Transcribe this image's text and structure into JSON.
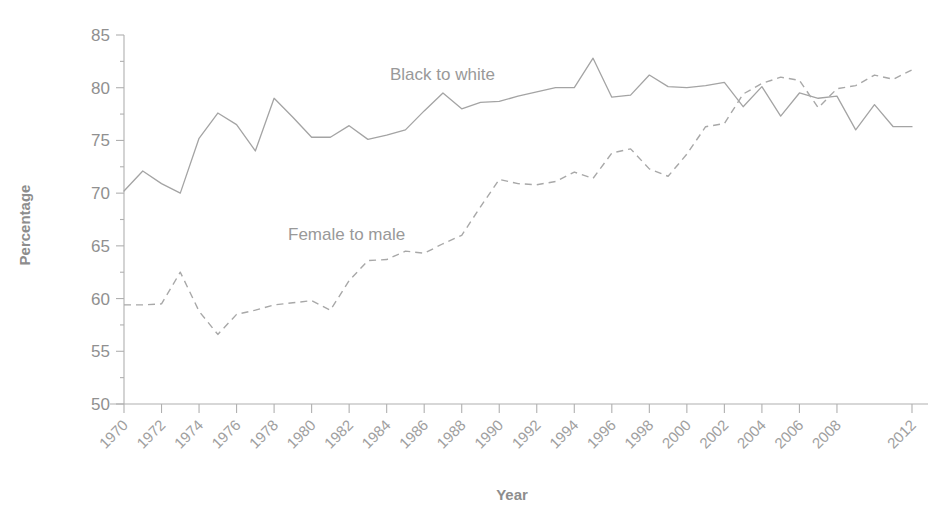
{
  "chart_data": {
    "type": "line",
    "title": "",
    "xlabel": "Year",
    "ylabel": "Percentage",
    "xlim": [
      1970,
      2012
    ],
    "ylim": [
      50,
      85
    ],
    "ytick_labels": [
      "85",
      "80",
      "75",
      "70",
      "65",
      "60",
      "55",
      "50"
    ],
    "yticks": [
      85,
      80,
      75,
      70,
      65,
      60,
      55,
      50
    ],
    "xtick_labels": [
      "1970",
      "1972",
      "1974",
      "1976",
      "1978",
      "1980",
      "1982",
      "1984",
      "1986",
      "1988",
      "1990",
      "1992",
      "1994",
      "1996",
      "1998",
      "2000",
      "2002",
      "2004",
      "2006",
      "2008",
      "2012"
    ],
    "xticks": [
      1970,
      1972,
      1974,
      1976,
      1978,
      1980,
      1982,
      1984,
      1986,
      1988,
      1990,
      1992,
      1994,
      1996,
      1998,
      2000,
      2002,
      2004,
      2006,
      2008,
      2012
    ],
    "grid": false,
    "legend_position": "inline-annotation",
    "x": [
      1970,
      1971,
      1972,
      1973,
      1974,
      1975,
      1976,
      1977,
      1978,
      1979,
      1980,
      1981,
      1982,
      1983,
      1984,
      1985,
      1986,
      1987,
      1988,
      1989,
      1990,
      1991,
      1992,
      1993,
      1994,
      1995,
      1996,
      1997,
      1998,
      1999,
      2000,
      2001,
      2002,
      2003,
      2004,
      2005,
      2006,
      2007,
      2008,
      2009,
      2010,
      2011,
      2012
    ],
    "series": [
      {
        "name": "Black to white",
        "style": "solid",
        "color": "#a4a4a4",
        "annotation": "Black to white",
        "values": [
          70.2,
          72.1,
          70.9,
          70.0,
          75.2,
          77.6,
          76.5,
          74.0,
          79.0,
          77.2,
          75.3,
          75.3,
          76.4,
          75.1,
          75.5,
          76.0,
          77.8,
          79.5,
          78.0,
          78.6,
          78.7,
          79.2,
          79.6,
          80.0,
          80.0,
          82.8,
          79.1,
          79.3,
          81.2,
          80.1,
          80.0,
          80.2,
          80.5,
          78.2,
          80.1,
          77.3,
          79.5,
          79.0,
          79.2,
          76.0,
          78.4,
          76.3,
          76.3
        ]
      },
      {
        "name": "Female to male",
        "style": "dashed",
        "color": "#a8a8a8",
        "annotation": "Female to male",
        "values": [
          59.4,
          59.4,
          59.5,
          62.5,
          58.8,
          56.6,
          58.5,
          58.9,
          59.4,
          59.6,
          59.8,
          58.9,
          61.7,
          63.6,
          63.7,
          64.5,
          64.3,
          65.2,
          66.0,
          68.7,
          71.3,
          70.9,
          70.8,
          71.1,
          72.0,
          71.4,
          73.8,
          74.2,
          72.3,
          71.6,
          73.7,
          76.3,
          76.6,
          79.4,
          80.4,
          81.0,
          80.7,
          78.1,
          79.9,
          80.2,
          81.2,
          80.8,
          81.7
        ]
      }
    ]
  },
  "annotations": {
    "series1_label": "Black to white",
    "series2_label": "Female to male"
  },
  "axes": {
    "x_title": "Year",
    "y_title": "Percentage"
  }
}
